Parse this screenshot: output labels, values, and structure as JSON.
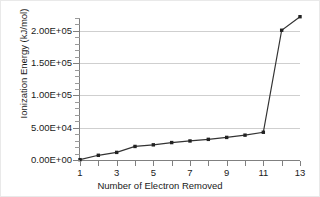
{
  "chart_data": {
    "type": "line",
    "title": "",
    "xlabel": "Number of Electron Removed",
    "ylabel": "Ionization Energy (kJ/mol)",
    "x": [
      1,
      2,
      3,
      4,
      5,
      6,
      7,
      8,
      9,
      10,
      11,
      12,
      13
    ],
    "values": [
      520,
      7300,
      11800,
      21000,
      23500,
      27000,
      29500,
      32000,
      35000,
      38500,
      43000,
      201000,
      222000
    ],
    "series": [
      {
        "name": "Ionization Energy",
        "values": [
          520,
          7300,
          11800,
          21000,
          23500,
          27000,
          29500,
          32000,
          35000,
          38500,
          43000,
          201000,
          222000
        ]
      }
    ],
    "xlim": [
      1,
      13
    ],
    "ylim": [
      0,
      220000
    ],
    "xticks": [
      1,
      3,
      5,
      7,
      9,
      11,
      13
    ],
    "xtick_labels": [
      "1",
      "3",
      "5",
      "7",
      "9",
      "11",
      "13"
    ],
    "xminor_ticks": [
      1,
      2,
      3,
      4,
      5,
      6,
      7,
      8,
      9,
      10,
      11,
      12,
      13
    ],
    "yticks": [
      0,
      50000,
      100000,
      150000,
      200000
    ],
    "ytick_labels": [
      "0.00E+00",
      "5.00E+04",
      "1.00E+05",
      "1.50E+05",
      "2.00E+05"
    ],
    "yminor_interval": 10000,
    "grid": true,
    "grid_axis": "y",
    "legend": false,
    "legend_position": "none",
    "line_color": "#333333",
    "marker_color": "#222222",
    "marker": "square",
    "gridline_color": "#cfcfcf",
    "axis_color": "#808080",
    "background_color": "#ffffff",
    "annotations": []
  }
}
